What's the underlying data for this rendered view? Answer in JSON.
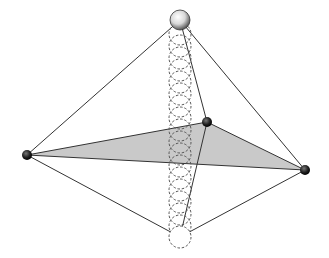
{
  "diagram": {
    "type": "geometric-bipyramid-with-sphere-path",
    "vertices": {
      "top": {
        "x": 180,
        "y": 20,
        "r": 10,
        "style": "shaded-sphere"
      },
      "left": {
        "x": 27,
        "y": 155,
        "r": 5,
        "style": "solid-dark"
      },
      "right": {
        "x": 305,
        "y": 170,
        "r": 5,
        "style": "solid-dark"
      },
      "middle": {
        "x": 207,
        "y": 122,
        "r": 5,
        "style": "solid-dark"
      },
      "bottom": {
        "x": 180,
        "y": 237,
        "r": 10,
        "style": "dashed-circle"
      }
    },
    "triangle_fill": "#c9c9c9",
    "line_color": "#333333",
    "dashed_color": "#555555",
    "sphere_path": {
      "x": 180,
      "r": 11,
      "y_start": 34,
      "y_end": 226,
      "count": 17
    }
  }
}
